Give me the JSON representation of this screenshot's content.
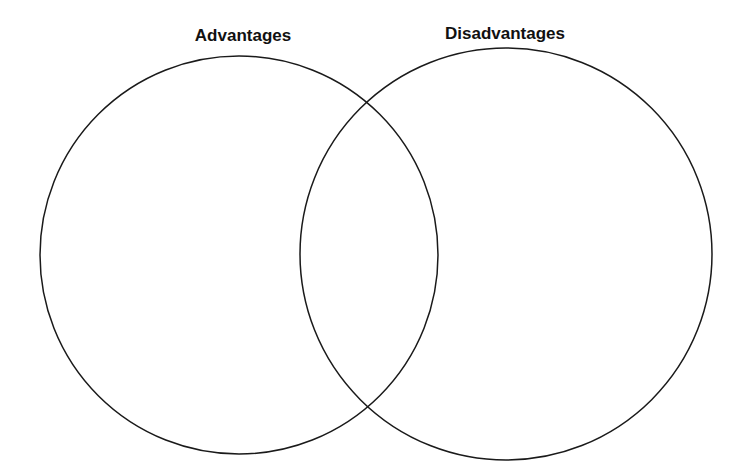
{
  "diagram": {
    "type": "venn",
    "sets": [
      {
        "label": "Advantages",
        "cx": 239,
        "cy": 255,
        "r": 199
      },
      {
        "label": "Disadvantages",
        "cx": 506,
        "cy": 254,
        "r": 206
      }
    ],
    "stroke_color": "#1a1a1a",
    "background": "#ffffff"
  }
}
